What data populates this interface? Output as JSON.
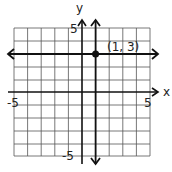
{
  "graph": {
    "x_axis_label": "x",
    "y_axis_label": "y",
    "x_min_label": "-5",
    "x_max_label": "5",
    "y_min_label": "-5",
    "y_max_label": "5",
    "point_label": "(1, 3)",
    "point": {
      "x": 1,
      "y": 3
    },
    "lines": [
      {
        "type": "horizontal",
        "equation": "y = 3"
      },
      {
        "type": "vertical",
        "equation": "x = 1"
      }
    ],
    "grid": {
      "xmin": -5,
      "xmax": 5,
      "ymin": -5,
      "ymax": 5,
      "step": 1
    },
    "colors": {
      "grid": "#555555",
      "axis": "#111111",
      "line": "#111111"
    }
  }
}
